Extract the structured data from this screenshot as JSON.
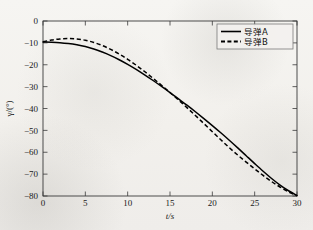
{
  "chart_data": {
    "type": "line",
    "title": "",
    "subtitle": "",
    "xlabel": "t/s",
    "ylabel": "γ/(°)",
    "xlim": [
      0,
      30
    ],
    "ylim": [
      -80,
      0
    ],
    "grid": false,
    "legend_position": "upper-right",
    "xticks": [
      "0",
      "5",
      "10",
      "15",
      "20",
      "25",
      "30"
    ],
    "xtick_values": [
      0,
      5,
      10,
      15,
      20,
      25,
      30
    ],
    "yticks": [
      "0",
      "−10",
      "−20",
      "−30",
      "−40",
      "−50",
      "−60",
      "−70",
      "−80"
    ],
    "ytick_values": [
      0,
      -10,
      -20,
      -30,
      -40,
      -50,
      -60,
      -70,
      -80
    ],
    "x": [
      0,
      1,
      2,
      3,
      4,
      5,
      6,
      7,
      8,
      9,
      10,
      11,
      12,
      13,
      14,
      15,
      16,
      17,
      18,
      19,
      20,
      21,
      22,
      23,
      24,
      25,
      26,
      27,
      28,
      29,
      30
    ],
    "series": [
      {
        "name": "导弹A",
        "style": "solid",
        "color": "#000000",
        "values": [
          -9.6,
          -9.7,
          -9.9,
          -10.3,
          -10.9,
          -11.7,
          -12.8,
          -14.2,
          -15.8,
          -17.7,
          -19.8,
          -22.1,
          -24.6,
          -27.2,
          -29.9,
          -32.7,
          -35.6,
          -38.5,
          -41.5,
          -44.6,
          -47.8,
          -51.1,
          -54.5,
          -58.0,
          -61.6,
          -65.2,
          -68.7,
          -72.0,
          -75.0,
          -77.6,
          -79.8
        ]
      },
      {
        "name": "导弹B",
        "style": "dashed",
        "color": "#000000",
        "values": [
          -9.5,
          -8.7,
          -8.2,
          -8.0,
          -8.2,
          -8.8,
          -9.8,
          -11.2,
          -13.0,
          -15.1,
          -17.5,
          -20.2,
          -23.1,
          -26.2,
          -29.4,
          -32.7,
          -36.1,
          -39.6,
          -43.2,
          -46.9,
          -50.6,
          -54.3,
          -57.9,
          -61.3,
          -64.5,
          -67.6,
          -70.6,
          -73.4,
          -75.9,
          -78.1,
          -79.9
        ]
      }
    ]
  },
  "legend": {
    "entries": [
      {
        "label": "导弹A",
        "style": "solid"
      },
      {
        "label": "导弹B",
        "style": "dashed"
      }
    ]
  },
  "axes": {
    "x_title": "t/s",
    "y_title": "γ/(°)"
  },
  "colors": {
    "curve": "#000000",
    "axis": "#3a3a3a",
    "legend_border": "#7a7a7a",
    "background": "#f2f0ec"
  }
}
